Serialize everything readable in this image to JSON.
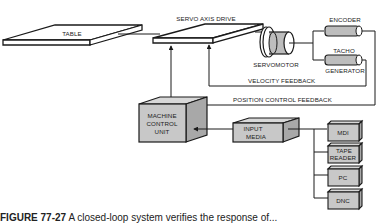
{
  "diagram": {
    "labels": {
      "table": "TABLE",
      "servo_axis_drive": "SERVO AXIS DRIVE",
      "servomotor": "SERVOMOTOR",
      "encoder": "ENCODER",
      "tacho_line1": "TACHO",
      "tacho_line2": "GENERATOR",
      "velocity_feedback": "VELOCITY FEEDBACK",
      "position_feedback": "POSITION CONTROL FEEDBACK",
      "mcu_line1": "MACHINE",
      "mcu_line2": "CONTROL",
      "mcu_line3": "UNIT",
      "input_line1": "INPUT",
      "input_line2": "MEDIA",
      "mdi": "MDI",
      "tape_line1": "TAPE",
      "tape_line2": "READER",
      "pc": "PC",
      "dnc": "DNC"
    },
    "colors": {
      "box_fill": "#c8c8c8",
      "box_side": "#a8a8a8",
      "stroke": "#1a1a1a"
    }
  },
  "caption": {
    "figure_label": "FIGURE 77-27",
    "text": "A closed-loop system verifies the response of..."
  }
}
